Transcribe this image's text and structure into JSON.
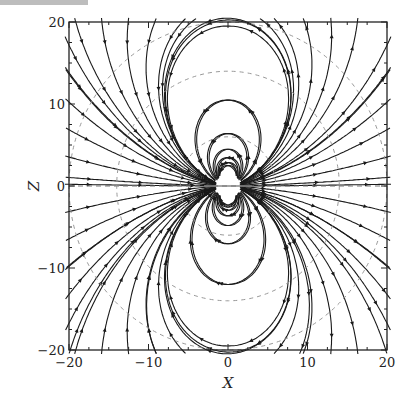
{
  "chart_data": {
    "type": "streamplot",
    "title": "",
    "xlabel": "X",
    "ylabel": "Z",
    "xlim": [
      -20,
      20
    ],
    "ylim": [
      -20,
      20
    ],
    "x_ticks": [
      -20,
      -10,
      0,
      10,
      20
    ],
    "y_ticks": [
      -20,
      -10,
      0,
      10,
      20
    ],
    "x_tick_labels": [
      "−20",
      "−10",
      "0",
      "10",
      "20"
    ],
    "y_tick_labels": [
      "−20",
      "−10",
      "0",
      "10",
      "20"
    ],
    "grid": false,
    "legend": null,
    "field": "magnetic-dipole-like, moment along +X at origin",
    "dashed_reference_lines": [
      "Z=0 horizontal",
      "dashed gray circles / field-line contours"
    ],
    "colors": {
      "streamlines": "#1a1a1a",
      "dashed": "#888888",
      "frame": "#222222"
    }
  },
  "labels": {
    "x": "X",
    "y": "Z"
  }
}
